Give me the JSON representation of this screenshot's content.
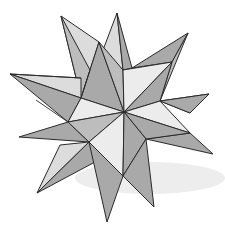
{
  "image": {
    "subject": "great-stellated-dodecahedron-sketch",
    "width": 225,
    "height": 233,
    "background": "#ffffff",
    "colors": {
      "dark_face": "#a9a9a9",
      "mid_face": "#bdbdbd",
      "light_face": "#dcdcdc",
      "lightest_face": "#ececec",
      "line": "#2a2a2a",
      "shadow": "#e6e6e6"
    },
    "center": [
      124,
      112
    ],
    "faces": [
      {
        "name": "spike-top-left-light",
        "tone": "light_face",
        "points": [
          [
            61,
            16
          ],
          [
            99,
            42
          ],
          [
            81,
            98
          ]
        ]
      },
      {
        "name": "spike-top-left-dark",
        "tone": "mid_face",
        "points": [
          [
            61,
            16
          ],
          [
            81,
            98
          ],
          [
            90,
            70
          ]
        ]
      },
      {
        "name": "spike-top-light",
        "tone": "light_face",
        "points": [
          [
            117,
            13
          ],
          [
            103,
            50
          ],
          [
            123,
            70
          ]
        ]
      },
      {
        "name": "spike-top-dark",
        "tone": "dark_face",
        "points": [
          [
            117,
            13
          ],
          [
            123,
            70
          ],
          [
            132,
            68
          ]
        ]
      },
      {
        "name": "spike-top-right-dark",
        "tone": "dark_face",
        "points": [
          [
            188,
            33
          ],
          [
            132,
            68
          ],
          [
            172,
            62
          ]
        ]
      },
      {
        "name": "spike-top-right-light",
        "tone": "mid_face",
        "points": [
          [
            188,
            33
          ],
          [
            172,
            62
          ],
          [
            160,
            101
          ]
        ]
      },
      {
        "name": "spike-center-top-left",
        "tone": "dark_face",
        "points": [
          [
            99,
            42
          ],
          [
            81,
            98
          ],
          [
            124,
            112
          ]
        ]
      },
      {
        "name": "spike-center-top-right",
        "tone": "mid_face",
        "points": [
          [
            99,
            42
          ],
          [
            124,
            112
          ],
          [
            123,
            70
          ]
        ]
      },
      {
        "name": "upper-right-light",
        "tone": "lightest_face",
        "points": [
          [
            123,
            70
          ],
          [
            172,
            62
          ],
          [
            124,
            112
          ]
        ]
      },
      {
        "name": "upper-right-dark",
        "tone": "dark_face",
        "points": [
          [
            172,
            62
          ],
          [
            160,
            101
          ],
          [
            124,
            112
          ]
        ]
      },
      {
        "name": "spike-far-left-light",
        "tone": "light_face",
        "points": [
          [
            10,
            74
          ],
          [
            81,
            78
          ],
          [
            81,
            98
          ]
        ]
      },
      {
        "name": "spike-far-left-dark",
        "tone": "dark_face",
        "points": [
          [
            10,
            74
          ],
          [
            81,
            98
          ],
          [
            68,
            122
          ]
        ]
      },
      {
        "name": "left-inner-light",
        "tone": "lightest_face",
        "points": [
          [
            81,
            98
          ],
          [
            124,
            112
          ],
          [
            68,
            122
          ]
        ]
      },
      {
        "name": "spike-mid-left-dark",
        "tone": "dark_face",
        "points": [
          [
            19,
            137
          ],
          [
            68,
            122
          ],
          [
            89,
            142
          ]
        ]
      },
      {
        "name": "left-lower-dark",
        "tone": "mid_face",
        "points": [
          [
            68,
            122
          ],
          [
            124,
            112
          ],
          [
            89,
            142
          ]
        ]
      },
      {
        "name": "spike-right-light",
        "tone": "lightest_face",
        "points": [
          [
            209,
            94
          ],
          [
            160,
            101
          ],
          [
            190,
            113
          ]
        ]
      },
      {
        "name": "spike-right-dark",
        "tone": "dark_face",
        "points": [
          [
            209,
            94
          ],
          [
            190,
            113
          ],
          [
            160,
            101
          ]
        ]
      },
      {
        "name": "right-inner-light",
        "tone": "lightest_face",
        "points": [
          [
            160,
            101
          ],
          [
            124,
            112
          ],
          [
            190,
            133
          ]
        ]
      },
      {
        "name": "spike-lower-right-dark",
        "tone": "dark_face",
        "points": [
          [
            213,
            154
          ],
          [
            190,
            133
          ],
          [
            146,
            139
          ]
        ]
      },
      {
        "name": "right-lower-dark",
        "tone": "dark_face",
        "points": [
          [
            124,
            112
          ],
          [
            190,
            133
          ],
          [
            146,
            139
          ]
        ]
      },
      {
        "name": "center-lower-light",
        "tone": "lightest_face",
        "points": [
          [
            89,
            142
          ],
          [
            124,
            112
          ],
          [
            123,
            176
          ]
        ]
      },
      {
        "name": "center-lower-dark",
        "tone": "dark_face",
        "points": [
          [
            124,
            112
          ],
          [
            146,
            139
          ],
          [
            123,
            176
          ]
        ]
      },
      {
        "name": "spike-bottom-left-light",
        "tone": "light_face",
        "points": [
          [
            37,
            193
          ],
          [
            60,
            145
          ],
          [
            89,
            142
          ]
        ]
      },
      {
        "name": "spike-bottom-left-dark",
        "tone": "dark_face",
        "points": [
          [
            37,
            193
          ],
          [
            89,
            142
          ],
          [
            95,
            162
          ]
        ]
      },
      {
        "name": "spike-bottom-dark",
        "tone": "dark_face",
        "points": [
          [
            107,
            222
          ],
          [
            89,
            142
          ],
          [
            123,
            176
          ]
        ]
      },
      {
        "name": "spike-bottom-right-dark",
        "tone": "dark_face",
        "points": [
          [
            154,
            207
          ],
          [
            123,
            176
          ],
          [
            146,
            139
          ]
        ]
      }
    ],
    "extra_edges": [
      [
        [
          81,
          98
        ],
        [
          90,
          70
        ]
      ],
      [
        [
          36,
          100
        ],
        [
          68,
          122
        ]
      ],
      [
        [
          81,
          78
        ],
        [
          10,
          74
        ]
      ]
    ]
  }
}
